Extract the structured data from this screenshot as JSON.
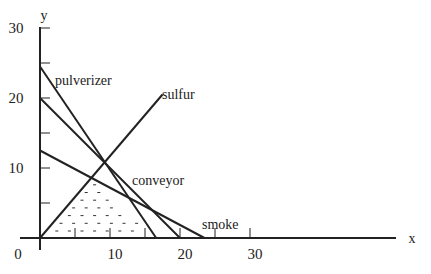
{
  "chart_data": {
    "type": "line",
    "title": "",
    "xlabel": "x",
    "ylabel": "y",
    "xlim": [
      0,
      50
    ],
    "ylim": [
      0,
      30
    ],
    "x_ticks": [
      0,
      5,
      10,
      15,
      20,
      25,
      30
    ],
    "x_tick_labels": [
      "0",
      "10",
      "20",
      "30"
    ],
    "y_ticks": [
      0,
      5,
      10,
      15,
      20,
      25,
      30
    ],
    "y_tick_labels": [
      "10",
      "20",
      "30"
    ],
    "origin_label": "0",
    "grid": false,
    "series": [
      {
        "name": "pulverizer",
        "points": [
          [
            0,
            24.5
          ],
          [
            16.6,
            0
          ]
        ]
      },
      {
        "name": "conveyor",
        "points": [
          [
            0,
            20
          ],
          [
            20,
            0
          ]
        ]
      },
      {
        "name": "smoke",
        "points": [
          [
            0,
            12.5
          ],
          [
            23.5,
            0
          ]
        ]
      },
      {
        "name": "sulfur",
        "points": [
          [
            0,
            0
          ],
          [
            17.5,
            20.5
          ]
        ]
      }
    ],
    "annotations": [
      {
        "text": "pulverizer",
        "x": 3,
        "y": 22.3
      },
      {
        "text": "sulfur",
        "x": 17,
        "y": 19.5
      },
      {
        "text": "conveyor",
        "x": 12.8,
        "y": 6
      },
      {
        "text": "smoke",
        "x": 23.5,
        "y": 1.5
      }
    ],
    "feasible_region": {
      "fill": "dotted",
      "vertices": [
        [
          0,
          0
        ],
        [
          7.7,
          9
        ],
        [
          11.5,
          5.6
        ],
        [
          16.6,
          0
        ]
      ]
    }
  },
  "labels": {
    "x_axis": "x",
    "y_axis": "y",
    "origin": "0",
    "x10": "10",
    "x20": "20",
    "x30": "30",
    "y10": "10",
    "y20": "20",
    "y30": "30",
    "pulverizer": "pulverizer",
    "sulfur": "sulfur",
    "conveyor": "conveyor",
    "smoke": "smoke"
  }
}
